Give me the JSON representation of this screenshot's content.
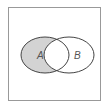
{
  "diagram": {
    "type": "venn",
    "sets": [
      {
        "label": "A",
        "shaded_region": "A only"
      },
      {
        "label": "B"
      }
    ],
    "colors": {
      "shade": "#d3d3d3",
      "stroke": "#444444",
      "border": "#888888"
    }
  }
}
